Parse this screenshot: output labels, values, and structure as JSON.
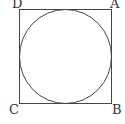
{
  "diagram": {
    "type": "square-with-inscribed-circle",
    "stroke_color": "#444444",
    "background": "#ffffff",
    "square": {
      "x": 19.5,
      "y": 9.5,
      "width": 92,
      "height": 94
    },
    "circle": {
      "cx": 65.5,
      "cy": 56.5,
      "r": 46
    },
    "vertices": [
      {
        "label": "D",
        "position": "top-left",
        "x": 12,
        "y": 8
      },
      {
        "label": "A",
        "position": "top-right",
        "x": 110,
        "y": 8
      },
      {
        "label": "C",
        "position": "bottom-left",
        "x": 9,
        "y": 114
      },
      {
        "label": "B",
        "position": "bottom-right",
        "x": 112,
        "y": 114
      }
    ]
  }
}
